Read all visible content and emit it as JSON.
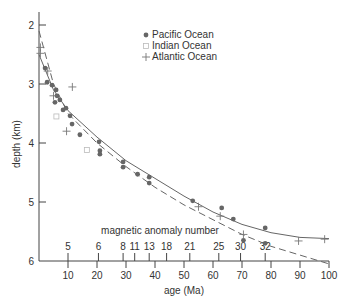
{
  "chart_data": {
    "type": "scatter",
    "title": "",
    "xlabel": "age (Ma)",
    "ylabel": "depth (km)",
    "xlim": [
      0,
      100
    ],
    "ylim": [
      6,
      2
    ],
    "y_inverted": true,
    "grid": false,
    "legend_position": "top-center",
    "x_ticks": [
      10,
      20,
      30,
      40,
      50,
      60,
      70,
      80,
      90,
      100
    ],
    "y_ticks": [
      2,
      3,
      4,
      5,
      6
    ],
    "secondary_axis": {
      "label": "magnetic anomaly number",
      "ticks": [
        {
          "label": "5",
          "age": 10
        },
        {
          "label": "6",
          "age": 20.5
        },
        {
          "label": "8",
          "age": 29
        },
        {
          "label": "11",
          "age": 33
        },
        {
          "label": "13",
          "age": 38
        },
        {
          "label": "18",
          "age": 44
        },
        {
          "label": "21",
          "age": 52
        },
        {
          "label": "25",
          "age": 62
        },
        {
          "label": "30",
          "age": 69.5
        },
        {
          "label": "32",
          "age": 78
        }
      ]
    },
    "series": [
      {
        "name": "Pacific Ocean",
        "marker": "dot",
        "color": "#666666",
        "points": [
          [
            2.1,
            2.73
          ],
          [
            2.8,
            2.97
          ],
          [
            4.5,
            3.02
          ],
          [
            5.9,
            3.1
          ],
          [
            6.2,
            3.2
          ],
          [
            5.5,
            3.31
          ],
          [
            7.2,
            3.27
          ],
          [
            8.3,
            3.44
          ],
          [
            9.3,
            3.41
          ],
          [
            10.7,
            3.54
          ],
          [
            11.4,
            3.68
          ],
          [
            14.1,
            3.86
          ],
          [
            20.7,
            3.98
          ],
          [
            21.0,
            4.13
          ],
          [
            21.0,
            4.19
          ],
          [
            29.0,
            4.32
          ],
          [
            29.0,
            4.41
          ],
          [
            34.0,
            4.53
          ],
          [
            38.0,
            4.58
          ],
          [
            38.0,
            4.68
          ],
          [
            53.0,
            4.98
          ],
          [
            63.0,
            5.1
          ],
          [
            67.0,
            5.29
          ],
          [
            78.0,
            5.44
          ],
          [
            70.5,
            5.65
          ],
          [
            78.0,
            5.7
          ]
        ]
      },
      {
        "name": "Indian Ocean",
        "marker": "square-open",
        "color": "#bbbbbb",
        "points": [
          [
            16.5,
            4.12
          ],
          [
            6.0,
            3.55
          ]
        ]
      },
      {
        "name": "Atlantic Ocean",
        "marker": "plus",
        "color": "#777777",
        "points": [
          [
            0.5,
            2.38
          ],
          [
            0.5,
            2.48
          ],
          [
            3.0,
            2.78
          ],
          [
            11.5,
            3.05
          ],
          [
            9.5,
            3.8
          ],
          [
            5.0,
            3.2
          ],
          [
            55.0,
            5.08
          ],
          [
            62.5,
            5.24
          ],
          [
            70.5,
            5.55
          ],
          [
            89.5,
            5.66
          ],
          [
            98.5,
            5.63
          ]
        ]
      }
    ],
    "curves": [
      {
        "name": "solid-fit",
        "style": "solid",
        "points": [
          [
            0,
            2.5
          ],
          [
            5,
            3.1
          ],
          [
            10,
            3.45
          ],
          [
            20,
            3.9
          ],
          [
            30,
            4.3
          ],
          [
            40,
            4.6
          ],
          [
            50,
            4.9
          ],
          [
            60,
            5.17
          ],
          [
            70,
            5.38
          ],
          [
            80,
            5.52
          ],
          [
            90,
            5.6
          ],
          [
            100,
            5.62
          ]
        ]
      },
      {
        "name": "dashed-fit",
        "style": "dashed",
        "points": [
          [
            0,
            2.1
          ],
          [
            5,
            3.0
          ],
          [
            10,
            3.5
          ],
          [
            20,
            4.0
          ],
          [
            30,
            4.4
          ],
          [
            40,
            4.75
          ],
          [
            50,
            5.05
          ],
          [
            60,
            5.3
          ],
          [
            70,
            5.55
          ],
          [
            80,
            5.75
          ],
          [
            90,
            5.9
          ],
          [
            100,
            6.05
          ]
        ]
      }
    ]
  }
}
